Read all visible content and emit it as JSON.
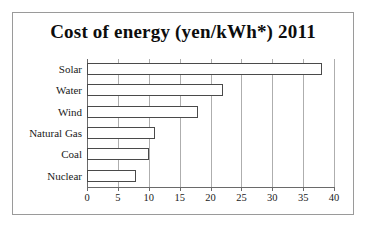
{
  "chart_data": {
    "type": "bar",
    "orientation": "horizontal",
    "title": "Cost of energy (yen/kWh*) 2011",
    "xlabel": "",
    "ylabel": "",
    "categories": [
      "Solar",
      "Water",
      "Wind",
      "Natural Gas",
      "Coal",
      "Nuclear"
    ],
    "values": [
      38,
      22,
      18,
      11,
      10,
      8
    ],
    "xlim": [
      0,
      40
    ],
    "xticks": [
      0,
      5,
      10,
      15,
      20,
      25,
      30,
      35,
      40
    ],
    "xtick_labels": [
      "0",
      "5",
      "10",
      "15",
      "20",
      "25",
      "30",
      "35",
      "40"
    ],
    "grid": "vertical",
    "legend": "none",
    "bar_fill": "#ffffff",
    "bar_edge": "#4a4a4a",
    "background": "#ffffff",
    "border_color": "#9a9a9a"
  }
}
